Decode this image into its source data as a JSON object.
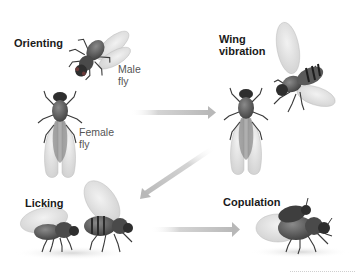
{
  "diagram": {
    "stages": [
      {
        "id": "orienting",
        "label": "Orienting",
        "flies": [
          {
            "role": "male",
            "label_line1": "Male",
            "label_line2": "fly"
          },
          {
            "role": "female",
            "label_line1": "Female",
            "label_line2": "fly"
          }
        ]
      },
      {
        "id": "wing-vibration",
        "label_line1": "Wing",
        "label_line2": "vibration"
      },
      {
        "id": "licking",
        "label": "Licking"
      },
      {
        "id": "copulation",
        "label": "Copulation"
      }
    ],
    "arrows": [
      {
        "from": "orienting",
        "to": "wing-vibration",
        "direction": "right"
      },
      {
        "from": "wing-vibration",
        "to": "licking",
        "direction": "down-left"
      },
      {
        "from": "licking",
        "to": "copulation",
        "direction": "right"
      }
    ],
    "colors": {
      "background": "#ffffff",
      "title_text": "#1a1a1a",
      "label_text": "#555555",
      "arrow": "#c8c8c8",
      "fly_body": "#5a5a5a",
      "fly_dark": "#2e2e2e",
      "wing": "#d9d9d9"
    }
  }
}
